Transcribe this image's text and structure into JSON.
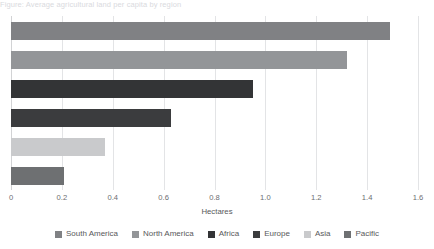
{
  "caption": {
    "text": "Figure: Average agricultural land per capita by region"
  },
  "chart_data": {
    "type": "bar",
    "orientation": "horizontal",
    "title": "",
    "subtitle": "",
    "xlabel": "Hectares",
    "ylabel": "",
    "xlim": [
      0,
      1.6
    ],
    "xticks": [
      0,
      0.2,
      0.4,
      0.6,
      0.8,
      1.0,
      1.2,
      1.4,
      1.6
    ],
    "xtick_labels": [
      "0",
      "0.2",
      "0.4",
      "0.6",
      "0.8",
      "1.0",
      "1.2",
      "1.4",
      "1.6"
    ],
    "grid": "vertical",
    "legend_position": "bottom",
    "categories": [
      "South America",
      "North America",
      "Africa",
      "Europe",
      "Asia",
      "Pacific"
    ],
    "values": [
      1.49,
      1.32,
      0.95,
      0.63,
      0.37,
      0.21
    ],
    "colors": [
      "#808184",
      "#939598",
      "#333436",
      "#3b3c3e",
      "#c9cacc",
      "#6e7072"
    ],
    "bars": [
      {
        "label": "South America",
        "value": 1.49,
        "color": "#808184"
      },
      {
        "label": "North America",
        "value": 1.32,
        "color": "#939598"
      },
      {
        "label": "Africa",
        "value": 0.95,
        "color": "#333436"
      },
      {
        "label": "Europe",
        "value": 0.63,
        "color": "#3b3c3e"
      },
      {
        "label": "Asia",
        "value": 0.37,
        "color": "#c9cacc"
      },
      {
        "label": "Pacific",
        "value": 0.21,
        "color": "#6e7072"
      }
    ],
    "legend": [
      {
        "label": "South America",
        "color": "#808184"
      },
      {
        "label": "North America",
        "color": "#939598"
      },
      {
        "label": "Africa",
        "color": "#333436"
      },
      {
        "label": "Europe",
        "color": "#3b3c3e"
      },
      {
        "label": "Asia",
        "color": "#c9cacc"
      },
      {
        "label": "Pacific",
        "color": "#6e7072"
      }
    ],
    "gridline_color": "#e3e4e6",
    "axis_color": "#d2d3d5",
    "background": "#ffffff"
  }
}
